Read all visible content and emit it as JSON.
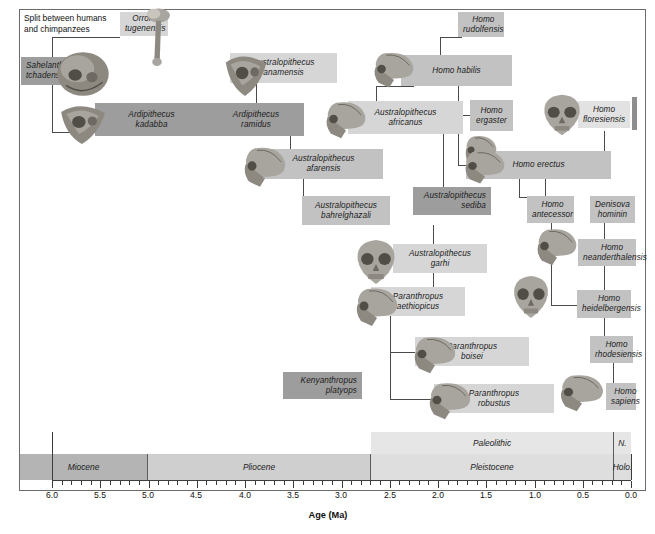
{
  "figure": {
    "axis_title": "Age (Ma)"
  },
  "note": {
    "text": "Split between humans\nand chimpanzees"
  },
  "taxa": [
    {
      "name": "Orrorin tugenensis",
      "label": "Orrorin\ntugenensis",
      "shade": "t-light",
      "align": "ac",
      "x": 120,
      "y": 12,
      "w": 48,
      "h": 24
    },
    {
      "name": "Sahelanthropus tchadensis",
      "label": "Sahelanthropus\ntchadensis",
      "shade": "t-dark",
      "align": "al",
      "x": 21,
      "y": 57,
      "w": 60,
      "h": 28
    },
    {
      "name": "Ardipithecus kadabba",
      "label": "Ardipithecus\nkadabba",
      "shade": "t-dark",
      "align": "ac",
      "x": 95,
      "y": 103,
      "w": 113,
      "h": 33
    },
    {
      "name": "Ardipithecus ramidus",
      "label": "Ardipithecus\nramidus",
      "shade": "t-dark",
      "align": "ac",
      "x": 208,
      "y": 103,
      "w": 96,
      "h": 33
    },
    {
      "name": "Australopithecus anamensis",
      "label": "Australopithecus\nanamensis",
      "shade": "t-light",
      "align": "ac",
      "x": 230,
      "y": 53,
      "w": 107,
      "h": 30
    },
    {
      "name": "Australopithecus afarensis",
      "label": "Australopithecus\nafarensis",
      "shade": "t-mid",
      "align": "ac",
      "x": 264,
      "y": 149,
      "w": 119,
      "h": 30
    },
    {
      "name": "Australopithecus bahrelghazali",
      "label": "Australopithecus\nbahrelghazali",
      "shade": "t-mid",
      "align": "ac",
      "x": 302,
      "y": 196,
      "w": 88,
      "h": 29
    },
    {
      "name": "Australopithecus garhi",
      "label": "Australopithecus\ngarhi",
      "shade": "t-light",
      "align": "ac",
      "x": 393,
      "y": 244,
      "w": 94,
      "h": 29
    },
    {
      "name": "Australopithecus africanus",
      "label": "Australopithecus\nafricanus",
      "shade": "t-light",
      "align": "ac",
      "x": 348,
      "y": 101,
      "w": 115,
      "h": 33
    },
    {
      "name": "Australopithecus sediba",
      "label": "Australopithecus\nsediba",
      "shade": "t-dark",
      "align": "ar",
      "x": 413,
      "y": 187,
      "w": 78,
      "h": 28
    },
    {
      "name": "Kenyanthropus platyops",
      "label": "Kenyanthropus\nplatyops",
      "shade": "t-dark",
      "align": "ar",
      "x": 283,
      "y": 372,
      "w": 79,
      "h": 27
    },
    {
      "name": "Paranthropus aethiopicus",
      "label": "Paranthropus\naethiopicus",
      "shade": "t-light",
      "align": "ac",
      "x": 371,
      "y": 287,
      "w": 94,
      "h": 29
    },
    {
      "name": "Paranthropus boisei",
      "label": "Paranthropus\nboisei",
      "shade": "t-light",
      "align": "ac",
      "x": 415,
      "y": 337,
      "w": 114,
      "h": 29
    },
    {
      "name": "Paranthropus robustus",
      "label": "Paranthropus\nrobustus",
      "shade": "t-light",
      "align": "ac",
      "x": 434,
      "y": 384,
      "w": 120,
      "h": 29
    },
    {
      "name": "Homo rudolfensis",
      "label": "Homo\nrudolfensis",
      "shade": "t-mid",
      "align": "ac",
      "x": 458,
      "y": 12,
      "w": 46,
      "h": 25
    },
    {
      "name": "Homo habilis",
      "label": "Homo habilis",
      "shade": "t-mid",
      "align": "ac",
      "x": 401,
      "y": 55,
      "w": 111,
      "h": 31
    },
    {
      "name": "Homo ergaster",
      "label": "Homo\nergaster",
      "shade": "t-mid",
      "align": "ac",
      "x": 470,
      "y": 100,
      "w": 43,
      "h": 31
    },
    {
      "name": "Homo erectus",
      "label": "Homo erectus",
      "shade": "t-mid",
      "align": "ac",
      "x": 466,
      "y": 151,
      "w": 145,
      "h": 28
    },
    {
      "name": "Homo floresiensis",
      "label": "Homo\nfloresiensis",
      "shade": "t-pale",
      "align": "ac",
      "x": 578,
      "y": 101,
      "w": 52,
      "h": 27
    },
    {
      "name": "Homo antecessor",
      "label": "Homo\nantecessor",
      "shade": "t-mid",
      "align": "ac",
      "x": 527,
      "y": 196,
      "w": 47,
      "h": 27
    },
    {
      "name": "Denisova hominin",
      "label": "Denisova\nhominin",
      "shade": "t-mid",
      "align": "ac",
      "x": 590,
      "y": 196,
      "w": 45,
      "h": 27
    },
    {
      "name": "Homo neanderthalensis",
      "label": "Homo\nneanderthalensis",
      "shade": "t-mid",
      "align": "ac",
      "x": 578,
      "y": 239,
      "w": 58,
      "h": 27
    },
    {
      "name": "Homo heidelbergensis",
      "label": "Homo\nheidelbergensis",
      "shade": "t-mid",
      "align": "ac",
      "x": 577,
      "y": 290,
      "w": 54,
      "h": 28
    },
    {
      "name": "Homo rhodesiensis",
      "label": "Homo\nrhodesiensis",
      "shade": "t-mid",
      "align": "ac",
      "x": 590,
      "y": 336,
      "w": 43,
      "h": 27
    },
    {
      "name": "Homo sapiens",
      "label": "Homo\nsapiens",
      "shade": "t-mid",
      "align": "ac",
      "x": 606,
      "y": 383,
      "w": 30,
      "h": 27
    }
  ],
  "chart_data": {
    "type": "timeline",
    "xlabel": "Age (Ma)",
    "xlim": [
      6.0,
      0.0
    ],
    "x_direction": "decreasing",
    "tick_labels": [
      "6.0",
      "5.5",
      "5.0",
      "4.5",
      "4.0",
      "3.5",
      "3.0",
      "2.5",
      "2.0",
      "1.5",
      "1.0",
      "0.5",
      "0.0"
    ],
    "tick_values": [
      6.0,
      5.5,
      5.0,
      4.5,
      4.0,
      3.5,
      3.0,
      2.5,
      2.0,
      1.5,
      1.0,
      0.5,
      0.0
    ],
    "minor_tick_step": 0.1,
    "grid": false,
    "legend": "none",
    "epochs": [
      {
        "label": "Miocene",
        "start": 6.0,
        "end": 5.0,
        "shade": "b-darkest"
      },
      {
        "label": "Pliocene",
        "start": 5.0,
        "end": 2.58,
        "shade": "b-mid"
      },
      {
        "label": "Pleistocene",
        "start": 2.58,
        "end": 0.0117,
        "shade": "b-light"
      },
      {
        "label": "Holo.",
        "start": 0.0117,
        "end": 0.0,
        "shade": "b-light"
      }
    ],
    "cultural_periods": [
      {
        "label": "Paleolithic",
        "start": 2.58,
        "end": 0.012,
        "shade": "b-lighter"
      },
      {
        "label": "N.",
        "start": 0.012,
        "end": 0.0,
        "shade": "b-lighter"
      }
    ],
    "taxa_ranges": [
      {
        "name": "Orrorin tugenensis",
        "start": 6.2,
        "end": 5.7
      },
      {
        "name": "Sahelanthropus tchadensis",
        "start": 7.0,
        "end": 6.3
      },
      {
        "name": "Ardipithecus kadabba",
        "start": 5.8,
        "end": 5.2
      },
      {
        "name": "Ardipithecus ramidus",
        "start": 4.5,
        "end": 4.3
      },
      {
        "name": "Australopithecus anamensis",
        "start": 4.2,
        "end": 3.8
      },
      {
        "name": "Australopithecus afarensis",
        "start": 3.9,
        "end": 2.9
      },
      {
        "name": "Australopithecus bahrelghazali",
        "start": 3.6,
        "end": 3.0
      },
      {
        "name": "Australopithecus africanus",
        "start": 3.3,
        "end": 2.1
      },
      {
        "name": "Australopithecus garhi",
        "start": 2.6,
        "end": 2.5
      },
      {
        "name": "Australopithecus sediba",
        "start": 2.0,
        "end": 1.8
      },
      {
        "name": "Kenyanthropus platyops",
        "start": 3.5,
        "end": 3.2
      },
      {
        "name": "Paranthropus aethiopicus",
        "start": 2.7,
        "end": 2.3
      },
      {
        "name": "Paranthropus boisei",
        "start": 2.3,
        "end": 1.2
      },
      {
        "name": "Paranthropus robustus",
        "start": 2.0,
        "end": 1.2
      },
      {
        "name": "Homo rudolfensis",
        "start": 2.0,
        "end": 1.8
      },
      {
        "name": "Homo habilis",
        "start": 2.4,
        "end": 1.4
      },
      {
        "name": "Homo ergaster",
        "start": 1.9,
        "end": 1.4
      },
      {
        "name": "Homo erectus",
        "start": 1.9,
        "end": 0.1
      },
      {
        "name": "Homo floresiensis",
        "start": 0.1,
        "end": 0.05
      },
      {
        "name": "Homo antecessor",
        "start": 1.2,
        "end": 0.8
      },
      {
        "name": "Denisova hominin",
        "start": 0.4,
        "end": 0.04
      },
      {
        "name": "Homo neanderthalensis",
        "start": 0.4,
        "end": 0.04
      },
      {
        "name": "Homo heidelbergensis",
        "start": 0.6,
        "end": 0.3
      },
      {
        "name": "Homo rhodesiensis",
        "start": 0.3,
        "end": 0.12
      },
      {
        "name": "Homo sapiens",
        "start": 0.3,
        "end": 0.0
      }
    ]
  },
  "axis": {
    "ticks": [
      {
        "label": "6.0",
        "x": 52
      },
      {
        "label": "5.5",
        "x": 100
      },
      {
        "label": "5.0",
        "x": 148
      },
      {
        "label": "4.5",
        "x": 196
      },
      {
        "label": "4.0",
        "x": 245
      },
      {
        "label": "3.5",
        "x": 293
      },
      {
        "label": "3.0",
        "x": 341
      },
      {
        "label": "2.5",
        "x": 390
      },
      {
        "label": "2.0",
        "x": 438
      },
      {
        "label": "1.5",
        "x": 486
      },
      {
        "label": "1.0",
        "x": 535
      },
      {
        "label": "0.5",
        "x": 583
      },
      {
        "label": "0.0",
        "x": 631
      }
    ]
  },
  "bands": {
    "periods": [
      {
        "key": "paleolithic",
        "label": "Paleolithic",
        "shade": "b-lighter",
        "x": 371,
        "w": 243
      },
      {
        "key": "neolithic",
        "label": "N.",
        "shade": "b-lighter",
        "x": 614,
        "w": 17
      }
    ],
    "epochs": [
      {
        "key": "miocene",
        "label": "Miocene",
        "shade": "b-darkest",
        "x": 20,
        "w": 128
      },
      {
        "key": "pliocene",
        "label": "Pliocene",
        "shade": "b-mid",
        "x": 148,
        "w": 223
      },
      {
        "key": "pleistocene",
        "label": "Pleistocene",
        "shade": "b-light",
        "x": 371,
        "w": 243
      },
      {
        "key": "holocene",
        "label": "Holo.",
        "shade": "b-light",
        "x": 614,
        "w": 17
      }
    ]
  }
}
